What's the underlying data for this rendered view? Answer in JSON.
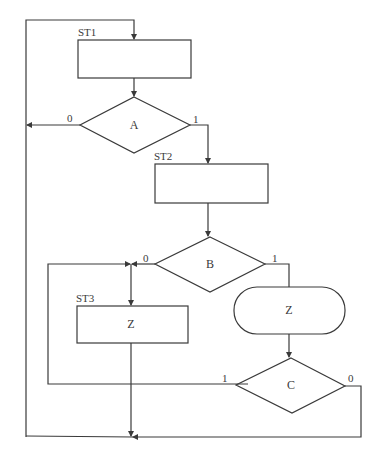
{
  "diagram": {
    "type": "ASM flowchart",
    "states": [
      {
        "id": "st1",
        "label": "ST1",
        "content": ""
      },
      {
        "id": "st2",
        "label": "ST2",
        "content": ""
      },
      {
        "id": "st3",
        "label": "ST3",
        "content": "Z"
      }
    ],
    "decisions": [
      {
        "id": "a",
        "label": "A",
        "false_label": "0",
        "true_label": "1"
      },
      {
        "id": "b",
        "label": "B",
        "false_label": "0",
        "true_label": "1"
      },
      {
        "id": "c",
        "label": "C",
        "true_label": "1",
        "false_label": "0"
      }
    ],
    "conditional_outputs": [
      {
        "id": "cond-z",
        "label": "Z"
      }
    ],
    "colors": {
      "line": "#3a3a3a",
      "background": "#ffffff"
    }
  }
}
